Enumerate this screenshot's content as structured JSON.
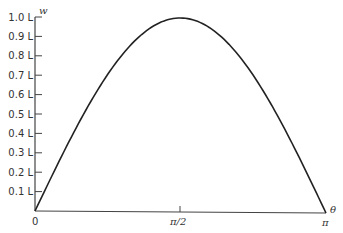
{
  "chart_data": {
    "type": "line",
    "title": "",
    "xlabel": "θ",
    "ylabel": "w",
    "x_ticks": [
      "0",
      "π/2",
      "π"
    ],
    "x_tick_values": [
      0,
      1.5708,
      3.1416
    ],
    "y_ticks": [
      "0.1 L",
      "0.2 L",
      "0.3 L",
      "0.4 L",
      "0.5 L",
      "0.6 L",
      "0.7 L",
      "0.8 L",
      "0.9 L",
      "1.0 L"
    ],
    "y_tick_values": [
      0.1,
      0.2,
      0.3,
      0.4,
      0.5,
      0.6,
      0.7,
      0.8,
      0.9,
      1.0
    ],
    "xlim": [
      0,
      3.1416
    ],
    "ylim": [
      0,
      1.0
    ],
    "grid": false,
    "legend": null,
    "series": [
      {
        "name": "w(θ) = L·sin θ",
        "x": [
          0,
          0.3927,
          0.7854,
          1.1781,
          1.5708,
          1.9635,
          2.3562,
          2.7489,
          3.1416
        ],
        "values": [
          0,
          0.383,
          0.707,
          0.924,
          1.0,
          0.924,
          0.707,
          0.383,
          0
        ]
      }
    ]
  },
  "axes": {
    "x_label": "θ",
    "y_label": "w",
    "origin_label": "0",
    "x_mid_label": "π/2",
    "x_end_label": "π"
  },
  "colors": {
    "line": "#222222",
    "axis": "#444444",
    "text": "#333333"
  }
}
